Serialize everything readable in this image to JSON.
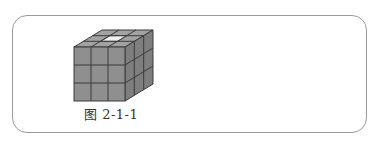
{
  "figure": {
    "caption": "图 2-1-1",
    "grid_size": 3,
    "colors": {
      "front_face": "#8f8f8f",
      "side_face": "#7e7e7e",
      "top_face": "#a2a2a2",
      "highlight_cell": "#f2f2f2",
      "grid_line": "#3a3a3a",
      "frame_border": "#9a9a9a"
    }
  }
}
